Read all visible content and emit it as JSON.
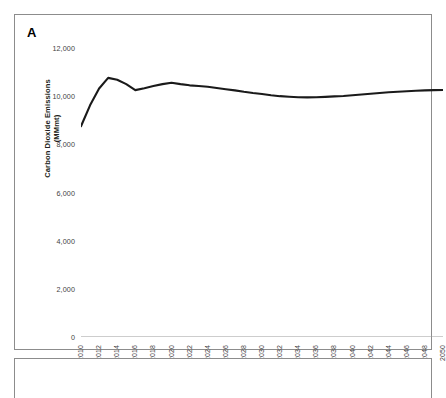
{
  "panel": {
    "letter": "A",
    "has_second_panel": true
  },
  "chart_data": {
    "type": "line",
    "title": "",
    "xlabel": "",
    "ylabel": "Carbon Dioxide Emissions (MMmt)",
    "ylabel_line1": "Carbon Dioxide Emissions",
    "ylabel_line2": "(MMmt)",
    "xlim": [
      2010,
      2050
    ],
    "ylim": [
      0,
      12000
    ],
    "ytick_labels": [
      "12,000",
      "10,000",
      "8,000",
      "6,000",
      "4,000",
      "2,000",
      "0"
    ],
    "ytick_values": [
      12000,
      10000,
      8000,
      6000,
      4000,
      2000,
      0
    ],
    "xtick_labels": [
      "2010",
      "2012",
      "2014",
      "2016",
      "2018",
      "2020",
      "2022",
      "2024",
      "2026",
      "2028",
      "2030",
      "2032",
      "2034",
      "2036",
      "2038",
      "2040",
      "2042",
      "2044",
      "2046",
      "2048",
      "2050"
    ],
    "grid": false,
    "legend": "none",
    "line_color": "#1a1a1a",
    "line_width": 2.1,
    "x": [
      2010,
      2011,
      2012,
      2013,
      2014,
      2015,
      2016,
      2017,
      2018,
      2019,
      2020,
      2021,
      2022,
      2023,
      2024,
      2025,
      2026,
      2027,
      2028,
      2029,
      2030,
      2031,
      2032,
      2033,
      2034,
      2035,
      2036,
      2037,
      2038,
      2039,
      2040,
      2041,
      2042,
      2043,
      2044,
      2045,
      2046,
      2047,
      2048,
      2049,
      2050
    ],
    "y": [
      8750,
      9620,
      10320,
      10760,
      10680,
      10500,
      10250,
      10330,
      10420,
      10500,
      10560,
      10500,
      10450,
      10420,
      10390,
      10340,
      10290,
      10240,
      10180,
      10130,
      10090,
      10040,
      10000,
      9975,
      9955,
      9950,
      9955,
      9970,
      9990,
      10010,
      10040,
      10070,
      10100,
      10130,
      10160,
      10185,
      10205,
      10225,
      10240,
      10250,
      10255
    ]
  }
}
